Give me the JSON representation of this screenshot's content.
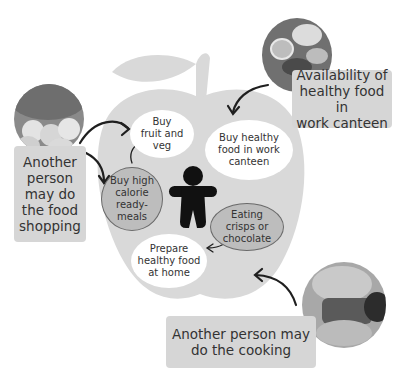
{
  "diagram": {
    "center_icon": "person-figure-icon",
    "apple_color": "#d9d9d9",
    "nodes": {
      "buy_fruit_veg": "Buy fruit and veg",
      "buy_fruit_veg_lines": [
        "Buy",
        "fruit and",
        "veg"
      ],
      "buy_healthy_canteen_lines": [
        "Buy healthy",
        "food in work",
        "canteen"
      ],
      "buy_ready_meals_lines": [
        "Buy high",
        "calorie",
        "ready-",
        "meals"
      ],
      "eating_crisps_lines": [
        "Eating",
        "crisps or",
        "chocolate"
      ],
      "prepare_healthy_lines": [
        "Prepare",
        "healthy food",
        "at home"
      ]
    },
    "external_factors": {
      "food_shopping_lines": [
        "Another",
        "person",
        "may do",
        "the food",
        "shopping"
      ],
      "canteen_availability_lines": [
        "Availability of",
        "healthy food in",
        "work canteen"
      ],
      "cooking_lines": [
        "Another person may",
        "do the cooking"
      ]
    },
    "photos": {
      "shopping": "fruit-market-photo",
      "canteen": "salad-plate-photo",
      "cooking": "cooking-dish-photo"
    }
  }
}
